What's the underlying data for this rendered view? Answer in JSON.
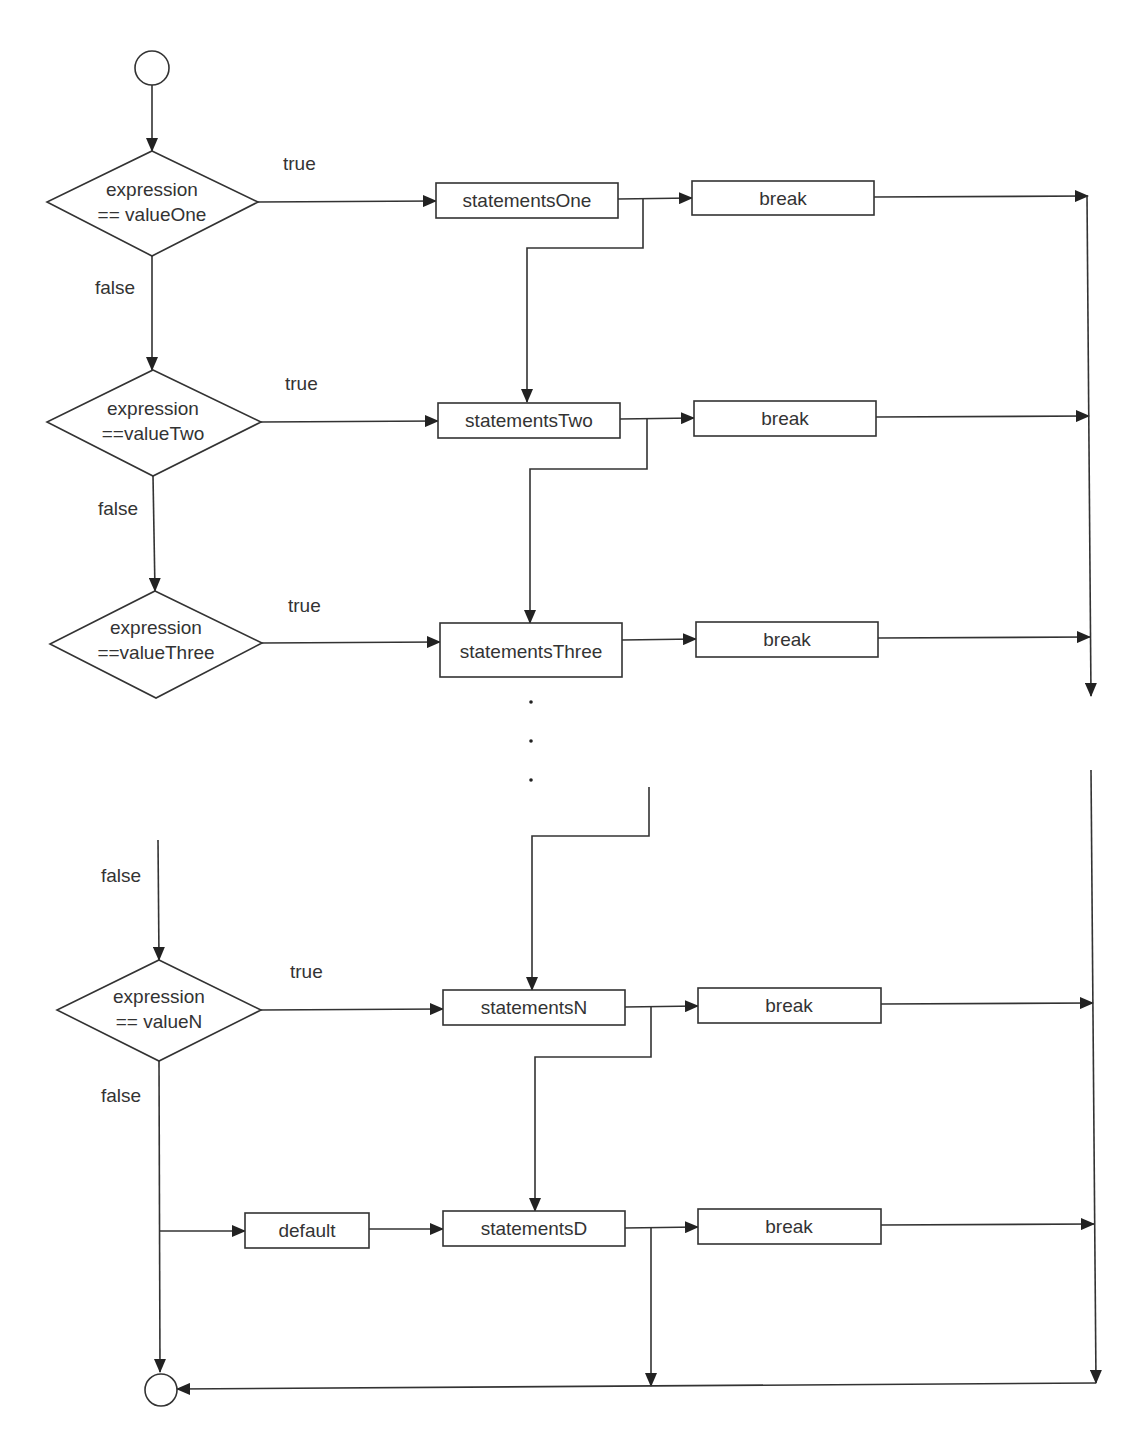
{
  "diagram": {
    "colors": {
      "stroke": "#333333",
      "text": "#333333",
      "background": "#ffffff"
    },
    "nodes": {
      "start": {
        "type": "start-circle"
      },
      "end": {
        "type": "end-circle"
      },
      "decisions": [
        {
          "line1": "expression",
          "line2": "== valueOne"
        },
        {
          "line1": "expression",
          "line2": "==valueTwo"
        },
        {
          "line1": "expression",
          "line2": "==valueThree"
        },
        {
          "line1": "expression",
          "line2": "== valueN"
        }
      ],
      "statements": [
        "statementsOne",
        "statementsTwo",
        "statementsThree",
        "statementsN",
        "statementsD"
      ],
      "breaks": [
        "break",
        "break",
        "break",
        "break",
        "break"
      ],
      "default": "default"
    },
    "edge_labels": {
      "true": "true",
      "false": "false"
    },
    "ellipsis": "..."
  }
}
